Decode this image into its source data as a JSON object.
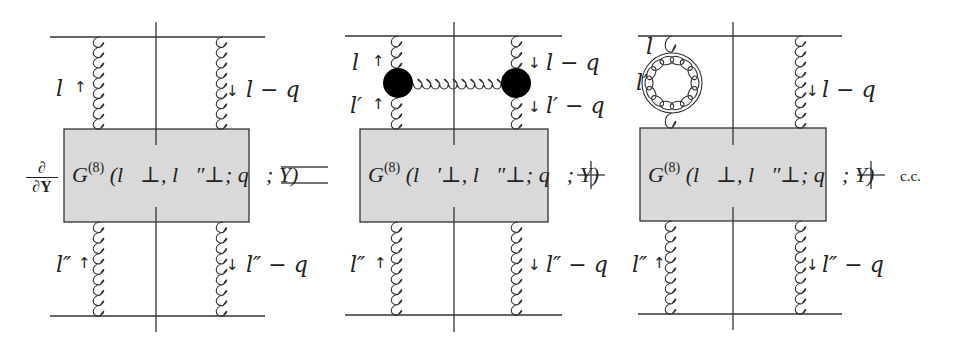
{
  "diagram": {
    "type": "feynman-diagram-equation",
    "colors": {
      "line": "#333333",
      "box_fill": "#d9d9d9",
      "box_stroke": "#333333",
      "blob": "#000000"
    },
    "lhs": {
      "operator_numerator": "∂",
      "operator_denominator": "∂Y",
      "box_label": "G",
      "box_superscript": "(8)",
      "box_args": "(l⃗⊥, l⃗″⊥; q⃗; Y)",
      "top_left_momentum": "l",
      "top_right_momentum": "l − q",
      "bottom_left_momentum": "l″",
      "bottom_right_momentum": "l″ − q"
    },
    "equals_sign": "=",
    "term1": {
      "box_label": "G",
      "box_superscript": "(8)",
      "box_args": "(l⃗′⊥, l⃗″⊥; q⃗; Y)",
      "top_left_momentum": "l",
      "mid_left_momentum": "l′",
      "top_right_momentum": "l − q",
      "mid_right_momentum": "l′ − q",
      "bottom_left_momentum": "l″",
      "bottom_right_momentum": "l″ − q"
    },
    "plus_sign_1": "+",
    "term2": {
      "box_label": "G",
      "box_superscript": "(8)",
      "box_args": "(l⃗⊥, l⃗″⊥; q⃗; Y)",
      "loop_top_momentum": "l",
      "loop_left_momentum": "l′",
      "top_right_momentum": "l − q",
      "bottom_left_momentum": "l″",
      "bottom_right_momentum": "l″ − q"
    },
    "plus_sign_2": "+",
    "complex_conjugate": "c.c."
  }
}
